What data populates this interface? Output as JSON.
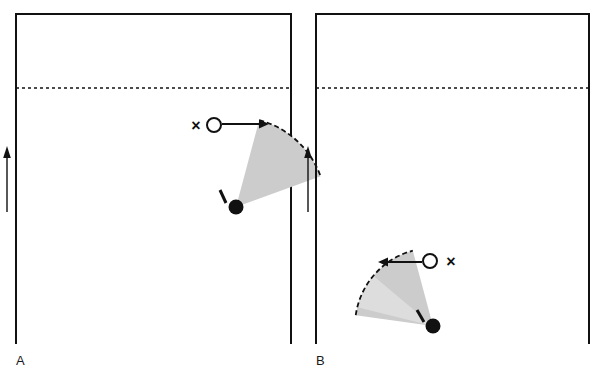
{
  "figure": {
    "type": "scientific-diagram",
    "background_color": "#ffffff",
    "stroke_color": "#111111",
    "fill_gray": "#cccccc",
    "fill_gray_light": "#dddddd"
  },
  "panels": [
    {
      "id": "A",
      "label": "A",
      "label_position": {
        "x": 16,
        "y": 365
      },
      "frame": {
        "x": 16,
        "y": 14,
        "width": 275,
        "height": 330
      },
      "dashed_line": {
        "y": 88,
        "x1": 16,
        "x2": 291,
        "dash": "3 3"
      },
      "flow_arrow": {
        "x": 7,
        "y_tail": 212,
        "y_head": 150,
        "direction": "up"
      },
      "pivot_dot": {
        "cx": 236,
        "cy": 207,
        "r": 7.5,
        "fill": "#111111"
      },
      "tick_mark": {
        "x1": 220,
        "y1": 190,
        "x2": 226,
        "y2": 203
      },
      "sector": {
        "apex_x": 236,
        "apex_y": 207,
        "radius": 90,
        "start_angle_deg": -75,
        "end_angle_deg": -20,
        "fill": "#cccccc",
        "arc_dashed": true
      },
      "open_circle": {
        "cx": 214,
        "cy": 125,
        "r": 7
      },
      "x_marker": {
        "x": 196,
        "y": 125,
        "glyph": "×"
      },
      "motion_arrow": {
        "x_tail": 223,
        "x_head": 268,
        "y": 124,
        "direction": "right"
      }
    },
    {
      "id": "B",
      "label": "B",
      "label_position": {
        "x": 316,
        "y": 365
      },
      "frame": {
        "x": 316,
        "y": 14,
        "width": 273,
        "height": 330
      },
      "dashed_line": {
        "y": 88,
        "x1": 316,
        "x2": 589,
        "dash": "3 3"
      },
      "flow_arrow": {
        "x": 308,
        "y_tail": 212,
        "y_head": 150,
        "direction": "up"
      },
      "pivot_dot": {
        "cx": 433,
        "cy": 326,
        "r": 7.5,
        "fill": "#111111"
      },
      "tick_mark": {
        "x1": 417,
        "y1": 310,
        "x2": 424,
        "y2": 322
      },
      "sector": {
        "apex_x": 433,
        "apex_y": 326,
        "radius": 78,
        "start_angle_deg": -105,
        "end_angle_deg": -172,
        "fill": "#cccccc",
        "arc_dashed": true
      },
      "inner_sector": {
        "apex_x": 433,
        "apex_y": 326,
        "radius": 78,
        "start_angle_deg": -140,
        "end_angle_deg": -166,
        "fill": "#dddddd"
      },
      "open_circle": {
        "cx": 430,
        "cy": 261,
        "r": 7
      },
      "x_marker": {
        "x": 450,
        "y": 261,
        "glyph": "×"
      },
      "motion_arrow": {
        "x_tail": 421,
        "x_head": 379,
        "y": 262,
        "direction": "left"
      }
    }
  ]
}
